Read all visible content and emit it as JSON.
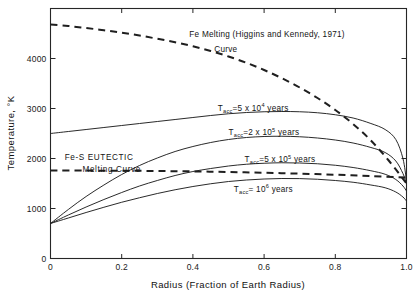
{
  "chart_data": {
    "type": "line",
    "title": "",
    "xlabel": "Radius  (Fraction of Earth Radius)",
    "ylabel": "Temperature, °K",
    "xlim": [
      0,
      1.0
    ],
    "ylim": [
      0,
      5000
    ],
    "grid": false,
    "legend_position": "inline-annotations",
    "xticks": [
      "0",
      "0.2",
      "0.4",
      "0.6",
      "0.8",
      "1.0"
    ],
    "xtick_values": [
      0,
      0.2,
      0.4,
      0.6,
      0.8,
      1.0
    ],
    "yticks": [
      "0",
      "1000",
      "2000",
      "3000",
      "4000"
    ],
    "ytick_values": [
      0,
      1000,
      2000,
      3000,
      4000
    ],
    "series": [
      {
        "name": "Fe Melting Curve (Higgins and Kennedy, 1971)",
        "style": "dashed",
        "x": [
          0.0,
          0.05,
          0.1,
          0.15,
          0.2,
          0.25,
          0.3,
          0.35,
          0.4,
          0.45,
          0.5,
          0.55,
          0.6,
          0.65,
          0.7,
          0.75,
          0.8,
          0.85,
          0.9,
          0.95,
          1.0
        ],
        "y": [
          4680,
          4650,
          4610,
          4565,
          4515,
          4460,
          4395,
          4325,
          4245,
          4150,
          4040,
          3915,
          3770,
          3605,
          3420,
          3210,
          2970,
          2690,
          2360,
          1960,
          1500
        ]
      },
      {
        "name": "Fe-S EUTECTIC Melting Curve",
        "style": "dashed",
        "x": [
          0.0,
          0.1,
          0.2,
          0.3,
          0.4,
          0.5,
          0.6,
          0.7,
          0.8,
          0.9,
          1.0
        ],
        "y": [
          1760,
          1758,
          1755,
          1750,
          1742,
          1730,
          1715,
          1697,
          1675,
          1650,
          1620
        ]
      },
      {
        "name": "T_acc = 5 x 10^4 years",
        "style": "solid",
        "x": [
          0.0,
          0.05,
          0.1,
          0.15,
          0.2,
          0.25,
          0.3,
          0.35,
          0.4,
          0.45,
          0.5,
          0.55,
          0.6,
          0.65,
          0.7,
          0.75,
          0.8,
          0.85,
          0.9,
          0.94,
          0.97,
          0.99,
          1.0
        ],
        "y": [
          2500,
          2540,
          2580,
          2620,
          2660,
          2700,
          2740,
          2780,
          2820,
          2860,
          2895,
          2920,
          2935,
          2940,
          2935,
          2915,
          2875,
          2810,
          2700,
          2580,
          2380,
          2000,
          1550
        ]
      },
      {
        "name": "T_acc = 2 x 10^5 years",
        "style": "solid",
        "x": [
          0.0,
          0.05,
          0.1,
          0.15,
          0.2,
          0.25,
          0.3,
          0.35,
          0.4,
          0.45,
          0.5,
          0.55,
          0.6,
          0.65,
          0.7,
          0.75,
          0.8,
          0.85,
          0.9,
          0.94,
          0.97,
          0.99,
          1.0
        ],
        "y": [
          700,
          980,
          1240,
          1470,
          1680,
          1860,
          2010,
          2140,
          2240,
          2320,
          2380,
          2420,
          2440,
          2445,
          2435,
          2410,
          2370,
          2310,
          2220,
          2120,
          1950,
          1700,
          1500
        ]
      },
      {
        "name": "T_acc = 5 x 10^5 years",
        "style": "solid",
        "x": [
          0.0,
          0.05,
          0.1,
          0.15,
          0.2,
          0.25,
          0.3,
          0.35,
          0.4,
          0.45,
          0.5,
          0.55,
          0.6,
          0.65,
          0.7,
          0.75,
          0.8,
          0.85,
          0.9,
          0.94,
          0.97,
          0.99,
          1.0
        ],
        "y": [
          700,
          870,
          1030,
          1180,
          1320,
          1450,
          1560,
          1660,
          1740,
          1800,
          1850,
          1885,
          1905,
          1915,
          1910,
          1895,
          1865,
          1820,
          1755,
          1685,
          1580,
          1450,
          1350
        ]
      },
      {
        "name": "T_acc = 10^6 years",
        "style": "solid",
        "x": [
          0.0,
          0.05,
          0.1,
          0.15,
          0.2,
          0.25,
          0.3,
          0.35,
          0.4,
          0.45,
          0.5,
          0.55,
          0.6,
          0.65,
          0.7,
          0.75,
          0.8,
          0.85,
          0.9,
          0.94,
          0.97,
          0.99,
          1.0
        ],
        "y": [
          700,
          810,
          920,
          1025,
          1125,
          1215,
          1300,
          1375,
          1440,
          1495,
          1540,
          1570,
          1590,
          1600,
          1598,
          1585,
          1560,
          1525,
          1470,
          1415,
          1330,
          1230,
          1150
        ]
      }
    ],
    "annotations": [
      {
        "id": "fe-melting-line1",
        "text": "Fe Melting (Higgins and Kennedy, 1971)",
        "x": 0.39,
        "y": 4430
      },
      {
        "id": "fe-melting-line2",
        "text": "Curve",
        "x": 0.46,
        "y": 4140
      },
      {
        "id": "fe-s-eutectic-line1",
        "text": "Fe-S  EUTECTIC",
        "x": 0.04,
        "y": 1975
      },
      {
        "id": "fe-s-eutectic-line2",
        "text": "Melting  Curve",
        "x": 0.09,
        "y": 1730
      },
      {
        "id": "tacc-5e4",
        "base": "T",
        "sub": "acc",
        "eq": "=5 x 10",
        "sup": "4",
        "tail": " years",
        "x": 0.47,
        "y": 2960
      },
      {
        "id": "tacc-2e5",
        "base": "T",
        "sub": "acc",
        "eq": "=2 x 10",
        "sup": "5",
        "tail": " years",
        "x": 0.5,
        "y": 2470
      },
      {
        "id": "tacc-5e5",
        "base": "T",
        "sub": "acc",
        "eq": "=5 x 10",
        "sup": "5",
        "tail": " years",
        "x": 0.545,
        "y": 1930
      },
      {
        "id": "tacc-1e6",
        "base": "T",
        "sub": "acc",
        "eq": "= 10",
        "sup": "6",
        "tail": " years",
        "x": 0.515,
        "y": 1340
      }
    ]
  },
  "colors": {
    "ink": "#1a1a1a",
    "frame": "#262626",
    "background": "#ffffff"
  }
}
